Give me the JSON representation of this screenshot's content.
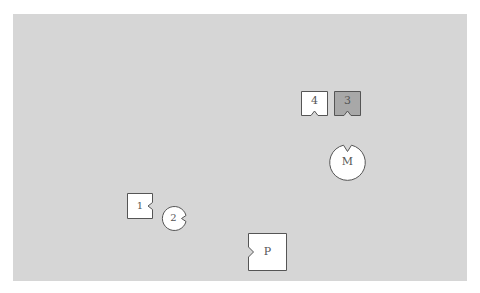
{
  "board": {
    "background": "#d6d6d6",
    "outer_background": "#ffffff"
  },
  "pieces": {
    "box4": {
      "label": "4",
      "shape": "square",
      "notch": "bottom",
      "fill": "#ffffff"
    },
    "box3": {
      "label": "3",
      "shape": "square",
      "notch": "bottom",
      "fill": "#a8a8a8"
    },
    "circleM": {
      "label": "M",
      "shape": "circle",
      "notch": "top",
      "fill": "#ffffff"
    },
    "box1": {
      "label": "1",
      "shape": "square",
      "notch": "right",
      "fill": "#ffffff"
    },
    "circle2": {
      "label": "2",
      "shape": "circle",
      "notch": "right",
      "fill": "#ffffff"
    },
    "boxP": {
      "label": "P",
      "shape": "square",
      "notch": "left",
      "fill": "#ffffff"
    }
  },
  "colors": {
    "stroke": "#555555",
    "text": "#555555"
  }
}
